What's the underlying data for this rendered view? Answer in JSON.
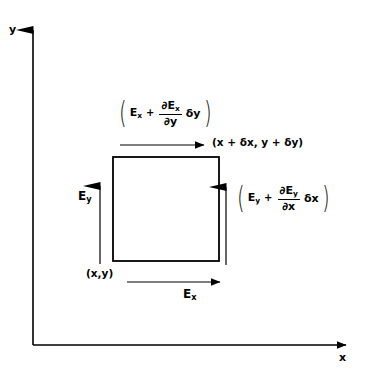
{
  "figure": {
    "background_color": "#ffffff",
    "stroke_color": "#000000"
  },
  "axes": {
    "x_label": "x",
    "y_label": "y",
    "origin": {
      "x": 33,
      "y": 345
    },
    "x_axis_end": {
      "x": 355,
      "y": 345
    },
    "y_axis_end": {
      "x": 33,
      "y": 18
    }
  },
  "element": {
    "name": "differential-rectangle",
    "left": 113,
    "top": 157,
    "width": 106,
    "height": 104,
    "corner_label_bottom_left": "(x,y)",
    "corner_label_top_right": "(x + δx, y + δy)"
  },
  "labels": {
    "left_field": {
      "base": "E",
      "subscript": "y"
    },
    "bottom_field": {
      "base": "E",
      "subscript": "x"
    }
  },
  "expressions": {
    "top": {
      "open_paren": "(",
      "base": "E",
      "base_sub": "x",
      "operator": "+",
      "numerator": "∂E",
      "numerator_sub": "x",
      "denominator": "∂y",
      "delta": "δy",
      "close_paren": ")",
      "plain": "(E_x + ∂E_x/∂y δy)"
    },
    "right": {
      "open_paren": "(",
      "base": "E",
      "base_sub": "y",
      "operator": "+",
      "numerator": "∂E",
      "numerator_sub": "y",
      "denominator": "∂x",
      "delta": "δx",
      "close_paren": ")",
      "plain": "(E_y + ∂E_y/∂x δx)"
    }
  },
  "arrows": {
    "top_horizontal": {
      "x1": 120,
      "y1": 145,
      "x2": 205,
      "y2": 145,
      "direction": "right"
    },
    "bottom_horizontal": {
      "x1": 127,
      "y1": 282,
      "x2": 221,
      "y2": 282,
      "direction": "right"
    },
    "left_vertical": {
      "x1": 100,
      "y1": 264,
      "x2": 100,
      "y2": 172,
      "direction": "up"
    },
    "right_vertical": {
      "x1": 226,
      "y1": 265,
      "x2": 226,
      "y2": 173,
      "direction": "up"
    }
  }
}
